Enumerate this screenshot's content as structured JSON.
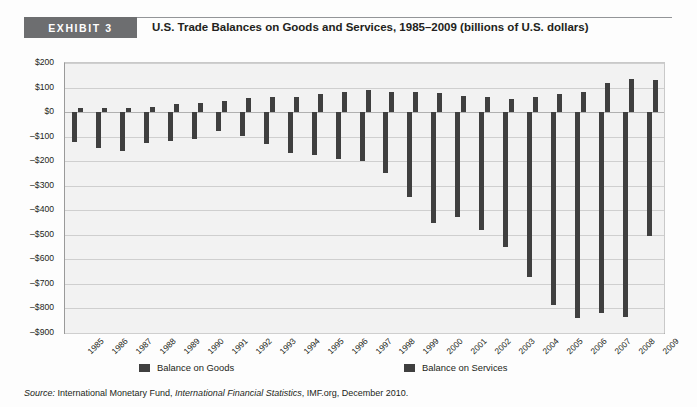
{
  "header": {
    "badge": "EXHIBIT 3",
    "title": "U.S. Trade Balances on Goods and Services, 1985–2009 (billions of U.S. dollars)"
  },
  "legend": {
    "goods": "Balance on Goods",
    "services": "Balance on Services"
  },
  "source": {
    "label": "Source:",
    "part1": " International Monetary Fund, ",
    "italic": "International Financial Statistics",
    "part2": ", IMF.org, December 2010."
  },
  "colors": {
    "bar": "#3f3f3f",
    "badge": "#6d6e70",
    "plot_bg": "#f2f2f2",
    "grid": "#cfcfcf"
  },
  "chart_data": {
    "type": "bar",
    "title": "U.S. Trade Balances on Goods and Services, 1985–2009 (billions of U.S. dollars)",
    "xlabel": "",
    "ylabel": "",
    "ylim": [
      -900,
      200
    ],
    "ytick_step": 100,
    "yticks": [
      "$200",
      "$100",
      "$0",
      "–$100",
      "–$200",
      "–$300",
      "–$400",
      "–$500",
      "–$600",
      "–$700",
      "–$800",
      "–$900"
    ],
    "ytick_values": [
      200,
      100,
      0,
      -100,
      -200,
      -300,
      -400,
      -500,
      -600,
      -700,
      -800,
      -900
    ],
    "grid": true,
    "legend_position": "bottom",
    "categories": [
      "1985",
      "1986",
      "1987",
      "1988",
      "1989",
      "1990",
      "1991",
      "1992",
      "1993",
      "1994",
      "1995",
      "1996",
      "1997",
      "1998",
      "1999",
      "2000",
      "2001",
      "2002",
      "2003",
      "2004",
      "2005",
      "2006",
      "2007",
      "2008",
      "2009"
    ],
    "series": [
      {
        "name": "Balance on Goods",
        "values": [
          -122,
          -145,
          -160,
          -127,
          -117,
          -111,
          -77,
          -97,
          -132,
          -166,
          -174,
          -191,
          -198,
          -248,
          -346,
          -452,
          -427,
          -482,
          -549,
          -670,
          -787,
          -838,
          -819,
          -835,
          -506
        ]
      },
      {
        "name": "Balance on Services",
        "values": [
          18,
          18,
          17,
          22,
          32,
          39,
          46,
          58,
          60,
          63,
          74,
          83,
          88,
          80,
          83,
          77,
          67,
          62,
          52,
          62,
          72,
          80,
          119,
          136,
          132
        ]
      }
    ]
  }
}
